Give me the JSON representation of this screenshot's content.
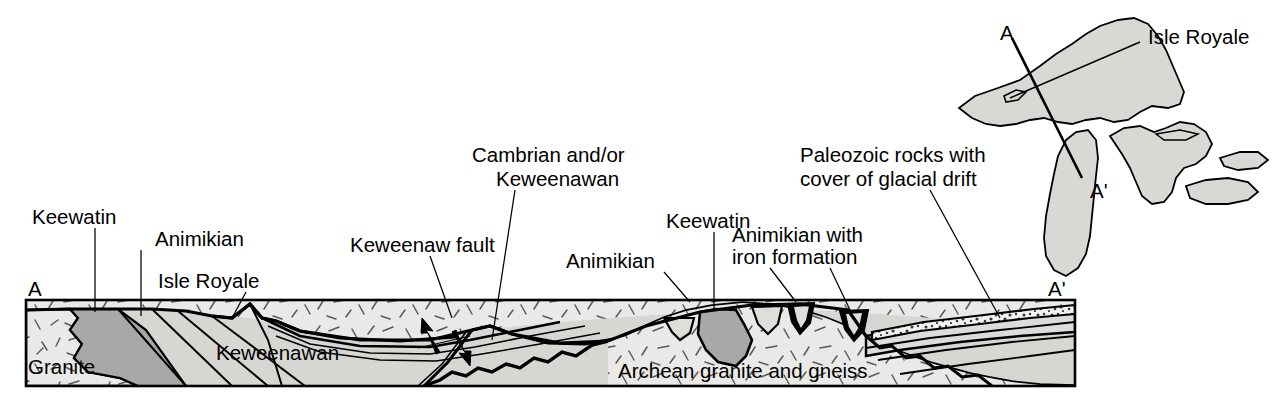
{
  "figure": {
    "type": "geologic-cross-section",
    "orientation": "A to A-prime, west-northwest to east-southeast",
    "section_endpoints": {
      "left": "A",
      "right": "A'"
    }
  },
  "colors": {
    "granite_light": "#e9e9e7",
    "keewatin_dark": "#a8a8a6",
    "keweenawan_mid": "#d6d6d3",
    "paleozoic_fill": "#dcdcda",
    "iron_formation": "#000000",
    "map_land": "#d8d8d5",
    "outline": "#000000",
    "background": "#ffffff"
  },
  "section_labels": {
    "keewatin_left": "Keewatin",
    "animikian_left": "Animikian",
    "isle_royale": "Isle Royale",
    "keweenaw_fault": "Keweenaw fault",
    "cambrian_keweenawan": {
      "line1": "Cambrian and/or",
      "line2": "Keweenawan"
    },
    "animikian_mid": "Animikian",
    "keewatin_right": "Keewatin",
    "animikian_iron": {
      "line1": "Animikian with",
      "line2": "iron formation"
    },
    "paleozoic": {
      "line1": "Paleozoic rocks with",
      "line2": "cover of glacial drift"
    },
    "granite_inblock": "Granite",
    "keweenawan_inblock": "Keweenawan",
    "archean_inblock": "Archean granite and gneiss",
    "endpoint_left": "A",
    "endpoint_right": "A'"
  },
  "inset_map": {
    "region": "Great Lakes",
    "isle_royale_label": "Isle Royale",
    "endpoint_a": "A",
    "endpoint_a_prime": "A'",
    "endpoint_a_prime_lower": "A'"
  }
}
